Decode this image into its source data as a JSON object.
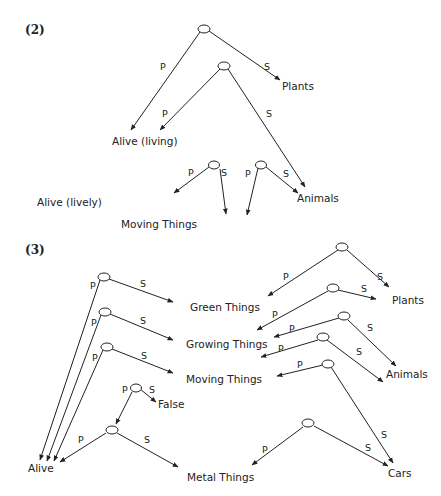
{
  "sections": [
    {
      "label": "(2)"
    },
    {
      "label": "(3)"
    }
  ],
  "edge_labels": {
    "p": "P",
    "s": "S"
  },
  "diagram2": {
    "nodes": {
      "plants": "Plants",
      "alive_living": "Alive (living)",
      "alive_lively": "Alive (lively)",
      "moving_things": "Moving Things",
      "animals": "Animals"
    }
  },
  "diagram3": {
    "nodes": {
      "green_things": "Green Things",
      "growing_things": "Growing Things",
      "moving_things": "Moving Things",
      "false": "False",
      "alive": "Alive",
      "metal_things": "Metal Things",
      "plants": "Plants",
      "animals": "Animals",
      "cars": "Cars"
    }
  },
  "colors": {
    "ink": "#222222",
    "background": "#ffffff"
  }
}
